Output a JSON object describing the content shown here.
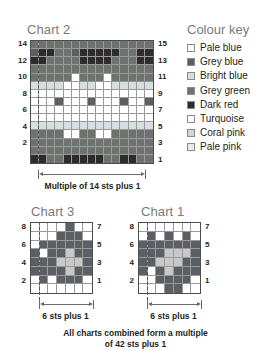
{
  "colour_key": {
    "title": "Colour key",
    "items": [
      {
        "name": "Pale blue",
        "color": "#ffffff"
      },
      {
        "name": "Grey blue",
        "color": "#5b5f63"
      },
      {
        "name": "Bright blue",
        "color": "#d8dde0"
      },
      {
        "name": "Grey green",
        "color": "#6e7370"
      },
      {
        "name": "Dark red",
        "color": "#2e2b2c"
      },
      {
        "name": "Turquoise",
        "color": "#fbfdfd"
      },
      {
        "name": "Coral pink",
        "color": "#d4d4d4"
      },
      {
        "name": "Pale pink",
        "color": "#ebebeb"
      }
    ]
  },
  "charts": [
    {
      "id": "chart2",
      "title": "Chart 2",
      "caption": "Multiple of 14 sts plus 1",
      "cols": 15,
      "rows": 15,
      "left_labels": [
        "14",
        "12",
        "10",
        "8",
        "6",
        "4",
        "2"
      ],
      "right_labels": [
        "15",
        "13",
        "11",
        "9",
        "7",
        "5",
        "3",
        "1"
      ],
      "repeat_start_col": 1,
      "repeat_end_col": 15,
      "chart_data": {
        "type": "heatmap",
        "title": "Chart 2",
        "xlabel": "stitches",
        "ylabel": "rows",
        "legend": [
          "Pale blue",
          "Grey blue",
          "Bright blue",
          "Grey green",
          "Dark red",
          "Turquoise",
          "Coral pink",
          "Pale pink"
        ],
        "palette": [
          "#ffffff",
          "#5b5f63",
          "#d8dde0",
          "#6e7370",
          "#2e2b2c",
          "#fbfdfd",
          "#d4d4d4",
          "#ebebeb"
        ],
        "comment": "rows listed top (row 15) to bottom (row 1); values are palette indices",
        "grid": [
          [
            3,
            3,
            3,
            3,
            3,
            3,
            3,
            3,
            3,
            3,
            3,
            3,
            3,
            3,
            3
          ],
          [
            1,
            4,
            4,
            3,
            3,
            1,
            4,
            4,
            4,
            4,
            4,
            3,
            3,
            4,
            4
          ],
          [
            4,
            4,
            3,
            3,
            3,
            3,
            4,
            4,
            4,
            4,
            3,
            3,
            3,
            4,
            4
          ],
          [
            3,
            3,
            3,
            3,
            3,
            3,
            3,
            3,
            3,
            3,
            3,
            3,
            3,
            3,
            3
          ],
          [
            3,
            3,
            3,
            3,
            3,
            0,
            3,
            3,
            3,
            0,
            3,
            3,
            3,
            3,
            3
          ],
          [
            2,
            2,
            2,
            2,
            0,
            0,
            2,
            2,
            0,
            0,
            2,
            2,
            2,
            2,
            2
          ],
          [
            0,
            0,
            0,
            0,
            0,
            0,
            0,
            0,
            0,
            0,
            0,
            0,
            0,
            0,
            0
          ],
          [
            0,
            0,
            0,
            1,
            0,
            0,
            0,
            1,
            0,
            0,
            0,
            1,
            0,
            0,
            1
          ],
          [
            0,
            0,
            0,
            0,
            0,
            0,
            0,
            0,
            0,
            0,
            0,
            0,
            0,
            0,
            0
          ],
          [
            0,
            0,
            0,
            0,
            0,
            0,
            0,
            0,
            0,
            0,
            0,
            0,
            0,
            0,
            0
          ],
          [
            2,
            2,
            2,
            2,
            2,
            2,
            2,
            2,
            2,
            2,
            2,
            2,
            2,
            2,
            2
          ],
          [
            3,
            3,
            3,
            3,
            0,
            0,
            3,
            3,
            0,
            0,
            3,
            3,
            3,
            3,
            3
          ],
          [
            3,
            3,
            3,
            3,
            3,
            3,
            3,
            3,
            3,
            3,
            3,
            3,
            3,
            3,
            3
          ],
          [
            3,
            3,
            3,
            3,
            3,
            3,
            3,
            3,
            3,
            3,
            3,
            3,
            3,
            3,
            3
          ],
          [
            4,
            4,
            3,
            3,
            4,
            4,
            4,
            4,
            4,
            3,
            3,
            4,
            4,
            3,
            3
          ]
        ]
      }
    },
    {
      "id": "chart3",
      "title": "Chart 3",
      "caption": "6 sts plus 1",
      "cols": 7,
      "rows": 8,
      "left_labels": [
        "8",
        "6",
        "4",
        "2"
      ],
      "right_labels": [
        "7",
        "5",
        "3",
        "1"
      ],
      "chart_data": {
        "type": "heatmap",
        "title": "Chart 3",
        "xlabel": "stitches",
        "ylabel": "rows",
        "legend": [
          "Pale blue",
          "Grey blue",
          "Bright blue"
        ],
        "palette": [
          "#ffffff",
          "#5b5f63",
          "#c8c8c8"
        ],
        "comment": "rows listed top (row 8) to bottom (row 1); values are palette indices",
        "grid": [
          [
            0,
            0,
            0,
            0,
            1,
            0,
            0
          ],
          [
            0,
            0,
            0,
            1,
            1,
            1,
            0
          ],
          [
            0,
            1,
            1,
            1,
            1,
            1,
            1
          ],
          [
            1,
            0,
            1,
            1,
            2,
            1,
            1
          ],
          [
            1,
            1,
            1,
            2,
            2,
            2,
            1
          ],
          [
            1,
            1,
            1,
            1,
            2,
            1,
            1
          ],
          [
            0,
            1,
            0,
            1,
            1,
            1,
            0
          ],
          [
            0,
            0,
            0,
            0,
            0,
            0,
            0
          ]
        ]
      }
    },
    {
      "id": "chart1",
      "title": "Chart 1",
      "caption": "6 sts plus 1",
      "cols": 7,
      "rows": 8,
      "left_labels": [
        "8",
        "6",
        "4",
        "2"
      ],
      "right_labels": [
        "7",
        "5",
        "3",
        "1"
      ],
      "chart_data": {
        "type": "heatmap",
        "title": "Chart 1",
        "xlabel": "stitches",
        "ylabel": "rows",
        "legend": [
          "Pale blue",
          "Grey blue",
          "Bright blue"
        ],
        "palette": [
          "#ffffff",
          "#5b5f63",
          "#c8c8c8"
        ],
        "comment": "rows listed top (row 8) to bottom (row 1); values are palette indices",
        "grid": [
          [
            0,
            0,
            0,
            0,
            0,
            0,
            0
          ],
          [
            0,
            1,
            0,
            1,
            0,
            1,
            0
          ],
          [
            1,
            1,
            1,
            1,
            1,
            1,
            1
          ],
          [
            1,
            1,
            1,
            2,
            2,
            2,
            1
          ],
          [
            1,
            1,
            2,
            2,
            2,
            1,
            1
          ],
          [
            1,
            0,
            1,
            2,
            1,
            1,
            1
          ],
          [
            0,
            0,
            1,
            1,
            1,
            1,
            0
          ],
          [
            0,
            0,
            0,
            1,
            1,
            0,
            0
          ]
        ]
      }
    }
  ],
  "footnote": {
    "line1": "All charts combined form a multiple",
    "line2": "of 42 sts plus 1"
  }
}
